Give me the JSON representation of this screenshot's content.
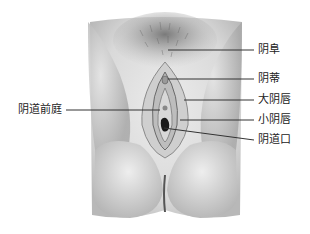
{
  "figure": {
    "type": "anatomical-illustration",
    "style": "grayscale pencil rendering"
  },
  "labels": {
    "mons_pubis": "阴阜",
    "clitoris": "阴蒂",
    "labia_majora": "大阴唇",
    "labia_minora": "小阴唇",
    "vaginal_orifice": "阴道口",
    "vestibule": "阴道前庭"
  },
  "colors": {
    "background": "#ffffff",
    "leader_line": "#333333",
    "label_text": "#222222"
  }
}
